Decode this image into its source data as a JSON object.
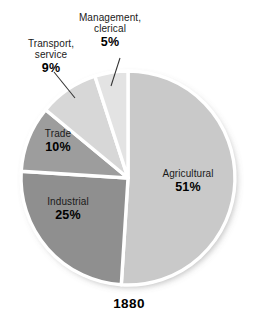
{
  "chart_data": {
    "type": "pie",
    "title": "",
    "subtitle": "",
    "year_label": "1880",
    "categories": [
      "Agricultural",
      "Industrial",
      "Trade",
      "Transport, service",
      "Management, clerical"
    ],
    "values": [
      51,
      25,
      10,
      9,
      5
    ],
    "value_suffix": "%",
    "legend": "none",
    "grid": false,
    "start_angle_deg": 0,
    "direction": "clockwise",
    "slices": [
      {
        "label": "Agricultural",
        "label_line1": "Agricultural",
        "label_line2": "",
        "percent": "51%",
        "value": 51,
        "color": "#c9c9c9",
        "start_deg": 0,
        "end_deg": 183.6,
        "label_placement": "inside",
        "leader_line": false
      },
      {
        "label": "Industrial",
        "label_line1": "Industrial",
        "label_line2": "",
        "percent": "25%",
        "value": 25,
        "color": "#8f8f8f",
        "start_deg": 183.6,
        "end_deg": 273.6,
        "label_placement": "inside",
        "leader_line": false
      },
      {
        "label": "Trade",
        "label_line1": "Trade",
        "label_line2": "",
        "percent": "10%",
        "value": 10,
        "color": "#9d9d9d",
        "start_deg": 273.6,
        "end_deg": 309.6,
        "label_placement": "inside",
        "leader_line": false
      },
      {
        "label": "Transport, service",
        "label_line1": "Transport,",
        "label_line2": "service",
        "percent": "9%",
        "value": 9,
        "color": "#d7d7d7",
        "start_deg": 309.6,
        "end_deg": 342.0,
        "label_placement": "outside",
        "leader_line": true
      },
      {
        "label": "Management, clerical",
        "label_line1": "Management,",
        "label_line2": "clerical",
        "percent": "5%",
        "value": 5,
        "color": "#e3e3e3",
        "start_deg": 342.0,
        "end_deg": 360.0,
        "label_placement": "outside",
        "leader_line": true
      }
    ],
    "colors": {
      "agricultural": "#c9c9c9",
      "industrial": "#8f8f8f",
      "trade": "#9d9d9d",
      "transport_service": "#d7d7d7",
      "management_clerical": "#e3e3e3",
      "slice_separator": "#ffffff",
      "label_text": "#1a1a1a",
      "percent_text": "#000000",
      "leader_line": "#333333",
      "background": "#ffffff"
    },
    "geometry": {
      "center_x": 128,
      "center_y": 178,
      "radius": 107
    }
  }
}
